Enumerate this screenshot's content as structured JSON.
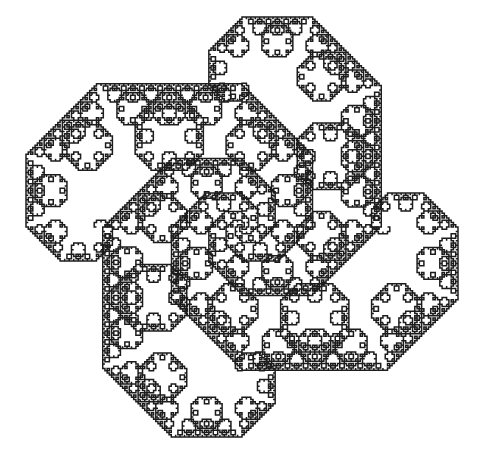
{
  "figure": {
    "name": "levy-c-curve-tapestry",
    "type": "fractal-line-drawing",
    "canvas": {
      "width": 481,
      "height": 468,
      "background_color": "#ffffff"
    },
    "stroke": {
      "color": "#1c1c1c",
      "width": 1.5,
      "fill": "none",
      "linejoin": "miter",
      "linecap": "butt"
    },
    "geometry": {
      "curve_family": "Levy C curve",
      "generator_angle_degrees": 45,
      "iterations": 12,
      "scale_factor_per_iteration": 0.7071067811865476,
      "symmetry": "4-fold rotational",
      "copies": 4,
      "copy_rotations_degrees": [
        0,
        90,
        180,
        270
      ],
      "center_is_hollow": true,
      "bounding_box": {
        "x_min": 26,
        "y_min": 17,
        "x_max": 458,
        "y_max": 437,
        "width": 432,
        "height": 420
      },
      "center_point": {
        "x": 242,
        "y": 227
      },
      "base_segment_length": 432,
      "micro_step_length_px": 4.5
    }
  },
  "chart_data": {
    "type": "line",
    "xlabel": "",
    "ylabel": "",
    "grid": false,
    "legend": null,
    "xlim": [
      0,
      481
    ],
    "ylim": [
      0,
      468
    ],
    "series": [
      {
        "name": "levy-c-curve-quadrant-0",
        "rotation_degrees": 0,
        "start": {
          "x": 26,
          "y": 227
        },
        "end": {
          "x": 242,
          "y": 227
        }
      },
      {
        "name": "levy-c-curve-quadrant-1",
        "rotation_degrees": 90,
        "start": {
          "x": 242,
          "y": 17
        },
        "end": {
          "x": 242,
          "y": 227
        }
      },
      {
        "name": "levy-c-curve-quadrant-2",
        "rotation_degrees": 180,
        "start": {
          "x": 458,
          "y": 227
        },
        "end": {
          "x": 242,
          "y": 227
        }
      },
      {
        "name": "levy-c-curve-quadrant-3",
        "rotation_degrees": 270,
        "start": {
          "x": 242,
          "y": 437
        },
        "end": {
          "x": 242,
          "y": 227
        }
      }
    ]
  }
}
